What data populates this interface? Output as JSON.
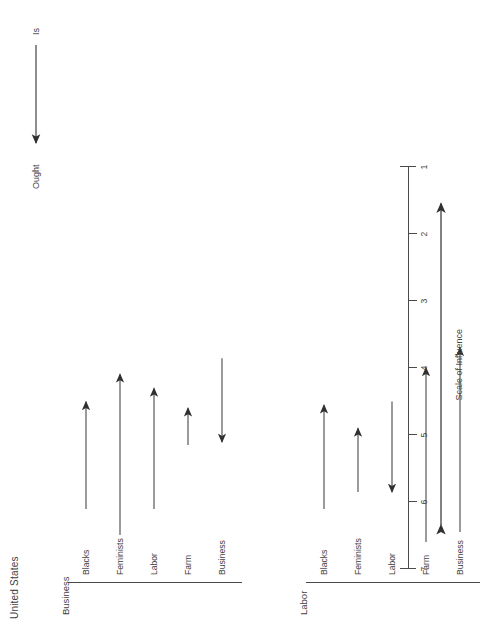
{
  "document": {
    "title": "United States"
  },
  "legend": {
    "from_label": "Is",
    "to_label": "Ought",
    "arrow_icon": "right-arrow-icon"
  },
  "axis": {
    "name": "Scale of Influence",
    "ticks": [
      "7",
      "6",
      "5",
      "4",
      "3",
      "2",
      "1"
    ],
    "direction_arrow_icon": "double-headed-arrow-icon"
  },
  "panels": [
    {
      "title": "Business",
      "categories": [
        "Business",
        "Farm",
        "Labor",
        "Feminists",
        "Blacks"
      ]
    },
    {
      "title": "Labor",
      "categories": [
        "Business",
        "Farm",
        "Labor",
        "Feminists",
        "Blacks"
      ]
    }
  ],
  "chart_data": {
    "type": "scatter",
    "title": "United States",
    "xlabel": "Scale of Influence",
    "ylabel": "",
    "xlim": [
      7,
      1
    ],
    "x_ticks": [
      7,
      6,
      5,
      4,
      3,
      2,
      1
    ],
    "x_axis_reversed": true,
    "grid": false,
    "legend": "Is → Ought",
    "annotation": "Arrows run from the 'Is' (current perceived influence) value to the 'Ought' (desired influence) value.",
    "series": [
      {
        "name": "Business respondents",
        "panel": "Business",
        "points": [
          {
            "group": "Business",
            "is": 3.85,
            "ought": 5.1
          },
          {
            "group": "Farm",
            "is": 5.15,
            "ought": 4.6
          },
          {
            "group": "Labor",
            "is": 6.1,
            "ought": 4.3
          },
          {
            "group": "Feminists",
            "is": 6.5,
            "ought": 4.1
          },
          {
            "group": "Blacks",
            "is": 6.1,
            "ought": 4.5
          }
        ]
      },
      {
        "name": "Labor respondents",
        "panel": "Labor",
        "points": [
          {
            "group": "Business",
            "is": 6.45,
            "ought": 3.7
          },
          {
            "group": "Farm",
            "is": 6.6,
            "ought": 4.0
          },
          {
            "group": "Labor",
            "is": 4.5,
            "ought": 5.85
          },
          {
            "group": "Feminists",
            "is": 5.85,
            "ought": 4.9
          },
          {
            "group": "Blacks",
            "is": 6.1,
            "ought": 4.55
          }
        ]
      }
    ]
  }
}
